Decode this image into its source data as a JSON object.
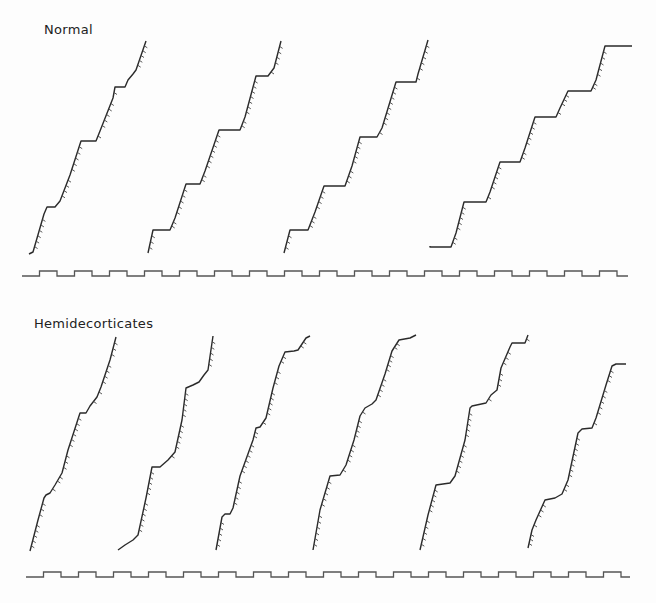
{
  "panels": [
    {
      "title": "Normal"
    },
    {
      "title": "Hemidecorticates"
    }
  ],
  "chart_data": [
    {
      "type": "line",
      "title": "Normal",
      "description": "Cumulative response records (cumulative recorder traces) with reinforcement hash marks; pen resets produce multiple segments",
      "xlabel": "",
      "ylabel": "",
      "grid": false,
      "series": [
        {
          "name": "Normal trace 1",
          "points": [
            [
              29,
              254
            ],
            [
              33,
              252
            ],
            [
              44,
              214
            ],
            [
              47,
              207
            ],
            [
              55,
              207
            ],
            [
              60,
              201
            ],
            [
              70,
              175
            ],
            [
              81,
              141
            ],
            [
              96,
              141
            ],
            [
              100,
              131
            ],
            [
              113,
              98
            ],
            [
              115,
              87
            ],
            [
              125,
              87
            ],
            [
              128,
              80
            ],
            [
              133,
              74
            ],
            [
              136,
              70
            ],
            [
              146,
              41
            ]
          ]
        },
        {
          "name": "Normal trace 2",
          "points": [
            [
              148,
              253
            ],
            [
              153,
              230
            ],
            [
              170,
              230
            ],
            [
              175,
              218
            ],
            [
              186,
              184
            ],
            [
              200,
              184
            ],
            [
              205,
              171
            ],
            [
              219,
              130
            ],
            [
              240,
              130
            ],
            [
              245,
              117
            ],
            [
              256,
              76
            ],
            [
              268,
              76
            ],
            [
              274,
              68
            ],
            [
              281,
              41
            ]
          ]
        },
        {
          "name": "Normal trace 3",
          "points": [
            [
              284,
              253
            ],
            [
              290,
              230
            ],
            [
              308,
              230
            ],
            [
              315,
              212
            ],
            [
              324,
              186
            ],
            [
              345,
              186
            ],
            [
              352,
              166
            ],
            [
              360,
              137
            ],
            [
              377,
              137
            ],
            [
              382,
              128
            ],
            [
              396,
              82
            ],
            [
              416,
              82
            ],
            [
              418,
              74
            ],
            [
              428,
              40
            ]
          ]
        },
        {
          "name": "Normal trace 4",
          "points": [
            [
              430,
              246
            ],
            [
              430,
              247
            ],
            [
              451,
              247
            ],
            [
              456,
              233
            ],
            [
              464,
              202
            ],
            [
              486,
              202
            ],
            [
              490,
              192
            ],
            [
              500,
              162
            ],
            [
              520,
              162
            ],
            [
              525,
              148
            ],
            [
              535,
              117
            ],
            [
              556,
              117
            ],
            [
              560,
              108
            ],
            [
              568,
              91
            ],
            [
              591,
              91
            ],
            [
              596,
              80
            ],
            [
              605,
              46
            ],
            [
              632,
              46
            ]
          ]
        }
      ],
      "timer_line": {
        "y_high": 271,
        "y_low": 276,
        "x_start": 22,
        "x_end": 628,
        "period": 35,
        "segments": 18
      }
    },
    {
      "type": "line",
      "title": "Hemidecorticates",
      "description": "Cumulative response records for hemidecorticate subjects",
      "xlabel": "",
      "ylabel": "",
      "grid": false,
      "series": [
        {
          "name": "Hemidecorticate trace 1",
          "points": [
            [
              30,
              551
            ],
            [
              38,
              520
            ],
            [
              44,
              498
            ],
            [
              46,
              495
            ],
            [
              50,
              493
            ],
            [
              55,
              485
            ],
            [
              62,
              473
            ],
            [
              68,
              450
            ],
            [
              80,
              413
            ],
            [
              86,
              413
            ],
            [
              90,
              406
            ],
            [
              97,
              397
            ],
            [
              101,
              387
            ],
            [
              110,
              360
            ],
            [
              116,
              337
            ]
          ]
        },
        {
          "name": "Hemidecorticate trace 2",
          "points": [
            [
              118,
              550
            ],
            [
              125,
              545
            ],
            [
              133,
              540
            ],
            [
              138,
              535
            ],
            [
              146,
              498
            ],
            [
              152,
              467
            ],
            [
              160,
              467
            ],
            [
              168,
              460
            ],
            [
              175,
              452
            ],
            [
              182,
              420
            ],
            [
              186,
              388
            ],
            [
              193,
              385
            ],
            [
              199,
              382
            ],
            [
              204,
              375
            ],
            [
              208,
              370
            ],
            [
              213,
              336
            ]
          ]
        },
        {
          "name": "Hemidecorticate trace 3",
          "points": [
            [
              216,
              550
            ],
            [
              222,
              517
            ],
            [
              225,
              514
            ],
            [
              230,
              514
            ],
            [
              233,
              508
            ],
            [
              240,
              476
            ],
            [
              253,
              440
            ],
            [
              256,
              428
            ],
            [
              260,
              427
            ],
            [
              266,
              418
            ],
            [
              273,
              388
            ],
            [
              279,
              366
            ],
            [
              285,
              352
            ],
            [
              294,
              351
            ],
            [
              298,
              350
            ],
            [
              306,
              338
            ],
            [
              310,
              336
            ]
          ]
        },
        {
          "name": "Hemidecorticate trace 4",
          "points": [
            [
              313,
              550
            ],
            [
              320,
              510
            ],
            [
              330,
              476
            ],
            [
              340,
              475
            ],
            [
              346,
              465
            ],
            [
              354,
              440
            ],
            [
              360,
              416
            ],
            [
              365,
              408
            ],
            [
              372,
              404
            ],
            [
              376,
              400
            ],
            [
              385,
              374
            ],
            [
              392,
              351
            ],
            [
              399,
              340
            ],
            [
              410,
              338
            ],
            [
              416,
              335
            ]
          ]
        },
        {
          "name": "Hemidecorticate trace 5",
          "points": [
            [
              420,
              550
            ],
            [
              428,
              515
            ],
            [
              436,
              485
            ],
            [
              450,
              483
            ],
            [
              455,
              476
            ],
            [
              465,
              440
            ],
            [
              470,
              408
            ],
            [
              472,
              406
            ],
            [
              486,
              403
            ],
            [
              491,
              395
            ],
            [
              497,
              390
            ],
            [
              501,
              368
            ],
            [
              510,
              347
            ],
            [
              512,
              343
            ],
            [
              525,
              343
            ],
            [
              528,
              335
            ]
          ]
        },
        {
          "name": "Hemidecorticate trace 6",
          "points": [
            [
              528,
              548
            ],
            [
              532,
              530
            ],
            [
              536,
              520
            ],
            [
              545,
              500
            ],
            [
              555,
              498
            ],
            [
              562,
              494
            ],
            [
              568,
              480
            ],
            [
              578,
              433
            ],
            [
              582,
              429
            ],
            [
              592,
              428
            ],
            [
              596,
              418
            ],
            [
              606,
              385
            ],
            [
              612,
              366
            ],
            [
              616,
              364
            ],
            [
              626,
              364
            ]
          ]
        }
      ],
      "timer_line": {
        "y_high": 572,
        "y_low": 577,
        "x_start": 26,
        "x_end": 630,
        "period": 35,
        "segments": 18
      }
    }
  ]
}
